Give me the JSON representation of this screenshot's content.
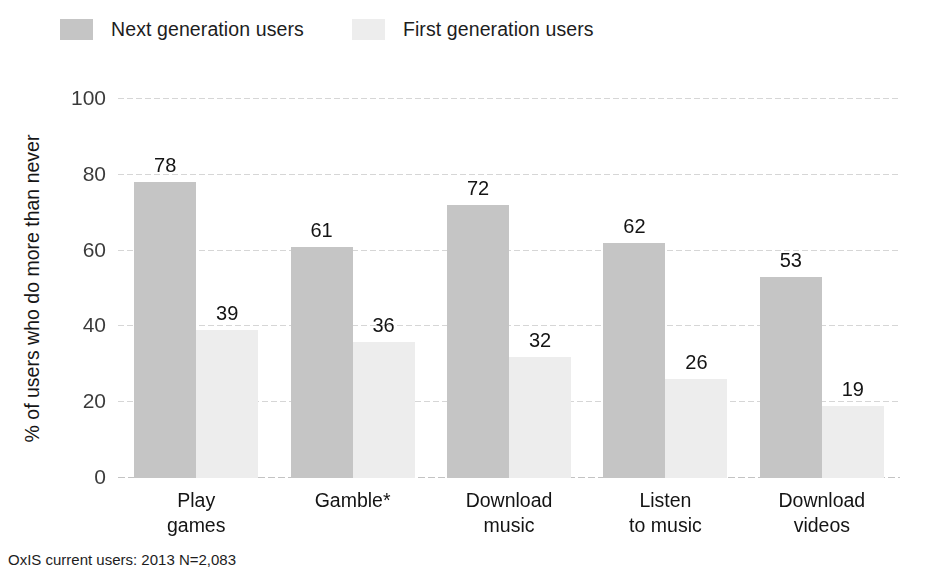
{
  "chart_data": {
    "type": "bar",
    "title": "",
    "xlabel": "",
    "ylabel": "% of users who do more than never",
    "ylim": [
      0,
      100
    ],
    "yticks": [
      0,
      20,
      40,
      60,
      80,
      100
    ],
    "grid": true,
    "legend_position": "top-left",
    "categories": [
      "Play\ngames",
      "Gamble*",
      "Download\nmusic",
      "Listen\nto music",
      "Download\nvideos"
    ],
    "category_lines": [
      [
        "Play",
        "games"
      ],
      [
        "Gamble*",
        ""
      ],
      [
        "Download",
        "music"
      ],
      [
        "Listen",
        "to music"
      ],
      [
        "Download",
        "videos"
      ]
    ],
    "series": [
      {
        "name": "Next generation users",
        "color": "#c5c5c5",
        "values": [
          78,
          61,
          72,
          62,
          53
        ]
      },
      {
        "name": "First generation users",
        "color": "#ededed",
        "values": [
          39,
          36,
          32,
          26,
          19
        ]
      }
    ],
    "footnote": "OxIS current users: 2013 N=2,083"
  }
}
